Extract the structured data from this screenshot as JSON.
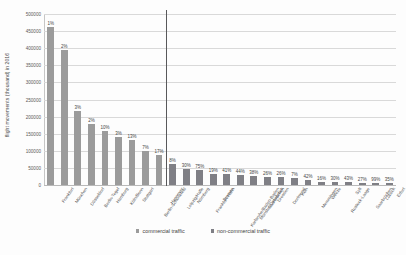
{
  "chart_data": {
    "type": "bar",
    "title": "",
    "xlabel": "",
    "ylabel": "flight movements (thousand) in 2016",
    "ylim": [
      0,
      500000
    ],
    "ytick_step": 50000,
    "yticks": [
      "0",
      "50000",
      "100000",
      "150000",
      "200000",
      "250000",
      "300000",
      "350000",
      "400000",
      "450000",
      "500000"
    ],
    "grid": true,
    "legend_position": "bottom",
    "group_divider_after_index": 8,
    "series": [
      {
        "name": "commercial traffic",
        "color": "#9b9b9b"
      },
      {
        "name": "non-commercial traffic",
        "color": "#7f7f85"
      }
    ],
    "categories": [
      "Frankfurt",
      "München",
      "Düsseldorf",
      "Berlin-Tegel",
      "Hamburg",
      "Köln/Bonn",
      "Stuttgart",
      "Berlin-Schönefeld",
      "Hannover",
      "Leipzig/Halle",
      "Nürnberg",
      "Frankfurt-Hahn",
      "Bremen",
      "Karlsruhe/Baden-Baden",
      "Münster/Osnabrück",
      "Saarbrücken",
      "Dresden",
      "Dortmund",
      "Köln",
      "Memmingen",
      "Weeze",
      "Rostock-Laage",
      "Sylt",
      "Saarbrücken",
      "Lübeck",
      "Erfurt"
    ],
    "values": [
      462000,
      394000,
      215000,
      178000,
      158000,
      140000,
      132000,
      98000,
      88000,
      62000,
      48000,
      44000,
      32000,
      31000,
      30000,
      25000,
      24000,
      22000,
      20000,
      14000,
      10000,
      9000,
      8000,
      7000,
      6000,
      5000
    ],
    "bar_labels": [
      "1%",
      "2%",
      "3%",
      "2%",
      "10%",
      "3%",
      "13%",
      "7%",
      "17%",
      "8%",
      "30%",
      "75%",
      "19%",
      "41%",
      "44%",
      "38%",
      "26%",
      "26%",
      "7%",
      "42%",
      "16%",
      "30%",
      "43%",
      "27%",
      "99%",
      "35%"
    ],
    "series_assignment": [
      "commercial",
      "commercial",
      "commercial",
      "commercial",
      "commercial",
      "commercial",
      "commercial",
      "commercial",
      "commercial",
      "non-commercial",
      "non-commercial",
      "non-commercial",
      "non-commercial",
      "non-commercial",
      "non-commercial",
      "non-commercial",
      "non-commercial",
      "non-commercial",
      "non-commercial",
      "non-commercial",
      "non-commercial",
      "non-commercial",
      "non-commercial",
      "non-commercial",
      "non-commercial",
      "non-commercial"
    ]
  },
  "legend": {
    "commercial_label": "commercial traffic",
    "noncommercial_label": "non-commercial traffic"
  }
}
